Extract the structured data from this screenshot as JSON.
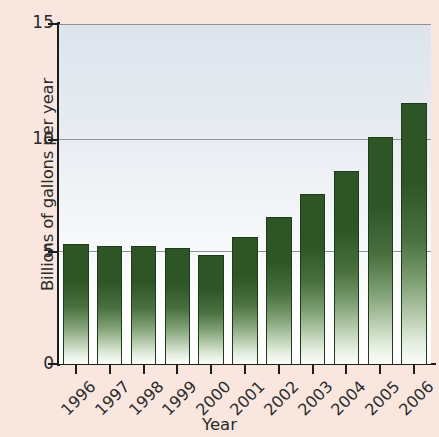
{
  "chart_data": {
    "type": "bar",
    "title": "",
    "xlabel": "Year",
    "ylabel": "Billions of gallons per year",
    "categories": [
      "1996",
      "1997",
      "1998",
      "1999",
      "2000",
      "2001",
      "2002",
      "2003",
      "2004",
      "2005",
      "2006"
    ],
    "values": [
      5.3,
      5.2,
      5.2,
      5.1,
      4.8,
      5.6,
      6.5,
      7.5,
      8.5,
      10.0,
      11.5
    ],
    "ylim": [
      0,
      15
    ],
    "yticks": [
      0,
      5,
      10,
      15
    ],
    "ytick_labels": [
      "0",
      "5",
      "10",
      "15"
    ],
    "grid": "horizontal",
    "legend": "none",
    "series_name": "Billions of gallons per year",
    "bar_color": "#2d5526",
    "plot_background": "#e3e9f0",
    "page_background": "#f9e7df",
    "axis_color": "#1d1d1d",
    "gridline_color": "#8e9196"
  }
}
